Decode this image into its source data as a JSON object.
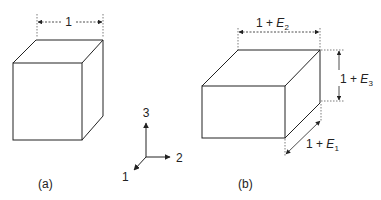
{
  "figure_a": {
    "caption": "(a)",
    "dimension_label": "1"
  },
  "figure_b": {
    "caption": "(b)",
    "dim_top": {
      "prefix": "1 + ",
      "var": "E",
      "sub": "2"
    },
    "dim_right": {
      "prefix": "1 + ",
      "var": "E",
      "sub": "3"
    },
    "dim_diag": {
      "prefix": "1 + ",
      "var": "E",
      "sub": "1"
    }
  },
  "axes": {
    "labels": [
      "1",
      "2",
      "3"
    ],
    "x_label": "2",
    "y_label": "3",
    "z_label": "1"
  },
  "colors": {
    "line": "#222222",
    "background": "#ffffff"
  }
}
